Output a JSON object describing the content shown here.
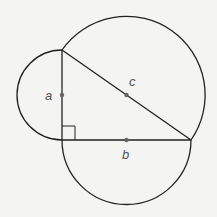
{
  "diagram": {
    "type": "geometry",
    "labels": {
      "a": "a",
      "b": "b",
      "c": "c"
    },
    "colors": {
      "background": "#f4f4f2",
      "stroke": "#222222",
      "point": "#666666",
      "label": "#555555"
    },
    "vertices": {
      "top": [
        62,
        50
      ],
      "right_angle": [
        62,
        140
      ],
      "right": [
        191,
        140
      ]
    },
    "midpoints": {
      "a": [
        62,
        95
      ],
      "b": [
        126.5,
        140
      ],
      "c": [
        126.5,
        95
      ]
    }
  }
}
